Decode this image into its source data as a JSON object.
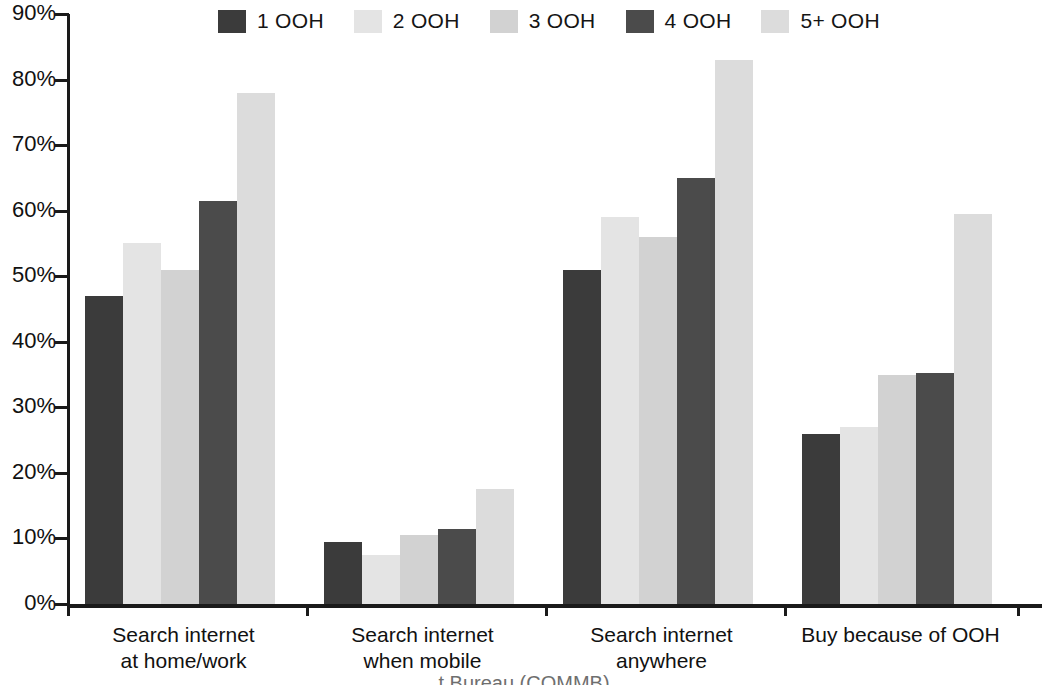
{
  "chart_data": {
    "type": "bar",
    "title": "",
    "subtitle": "",
    "xlabel": "",
    "ylabel": "",
    "ylim": [
      0,
      90
    ],
    "grid": false,
    "legend_position": "top",
    "categories": [
      "Search internet\nat home/work",
      "Search internet\nwhen mobile",
      "Search internet\nanywhere",
      "Buy because of OOH"
    ],
    "ytick_labels": [
      "90%",
      "80%",
      "70%",
      "60%",
      "50%",
      "40%",
      "30%",
      "20%",
      "10%",
      "0%"
    ],
    "ytick_values": [
      90,
      80,
      70,
      60,
      50,
      40,
      30,
      20,
      10,
      0
    ],
    "series": [
      {
        "name": "1 OOH",
        "color": "#3b3b3b",
        "values": [
          47.0,
          9.5,
          51.0,
          26.0
        ]
      },
      {
        "name": "2 OOH",
        "color": "#e4e4e4",
        "values": [
          55.0,
          7.5,
          59.0,
          27.0
        ]
      },
      {
        "name": "3 OOH",
        "color": "#d2d2d2",
        "values": [
          51.0,
          10.5,
          56.0,
          35.0
        ]
      },
      {
        "name": "4 OOH",
        "color": "#4b4b4b",
        "values": [
          61.5,
          11.5,
          65.0,
          35.2
        ]
      },
      {
        "name": "5+ OOH",
        "color": "#dcdcdc",
        "values": [
          78.0,
          17.5,
          83.0,
          59.5
        ]
      }
    ]
  },
  "legend": {
    "items": [
      {
        "label": "1 OOH",
        "color": "#3b3b3b"
      },
      {
        "label": "2 OOH",
        "color": "#e4e4e4"
      },
      {
        "label": "3 OOH",
        "color": "#d2d2d2"
      },
      {
        "label": "4 OOH",
        "color": "#4b4b4b"
      },
      {
        "label": "5+ OOH",
        "color": "#dcdcdc"
      }
    ]
  },
  "caption": "t Bureau (COMMB)"
}
